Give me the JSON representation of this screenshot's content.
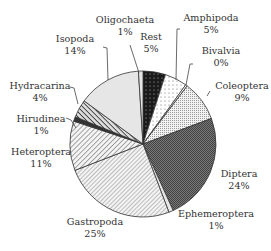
{
  "chart_data": {
    "type": "pie",
    "title": "",
    "start_angle_deg": 0,
    "direction": "clockwise",
    "center": [
      143,
      144
    ],
    "radius": 73,
    "slices": [
      {
        "label": "Rest",
        "value": 5,
        "pct_label": "5%",
        "pattern": "black-dots",
        "label_pos": [
          151,
          41
        ],
        "leader": null
      },
      {
        "label": "Amphipoda",
        "value": 5,
        "pct_label": "5%",
        "pattern": "sparse-dots",
        "label_pos": [
          211,
          22
        ],
        "leader": [
          [
            180,
            29
          ],
          [
            177,
            29
          ],
          [
            176,
            80
          ]
        ]
      },
      {
        "label": "Bivalvia",
        "value": 0.4,
        "pct_label": "0%",
        "pattern": "white",
        "label_pos": [
          221,
          55
        ],
        "leader": [
          [
            193,
            64
          ],
          [
            190,
            64
          ],
          [
            186,
            85
          ]
        ]
      },
      {
        "label": "Coleoptera",
        "value": 9,
        "pct_label": "9%",
        "pattern": "fine-dots",
        "label_pos": [
          242,
          90
        ],
        "leader": [
          [
            210,
            91
          ],
          [
            207,
            96
          ]
        ]
      },
      {
        "label": "Diptera",
        "value": 24,
        "pct_label": "24%",
        "pattern": "dark-checker",
        "label_pos": [
          239,
          178
        ],
        "leader": null
      },
      {
        "label": "Ephemeroptera",
        "value": 1,
        "pct_label": "1%",
        "pattern": "light-grey",
        "label_pos": [
          216,
          218
        ],
        "leader": null
      },
      {
        "label": "Gastropoda",
        "value": 25,
        "pct_label": "25%",
        "pattern": "fine-diag",
        "label_pos": [
          95,
          226
        ],
        "leader": null
      },
      {
        "label": "Heteroptera",
        "value": 11,
        "pct_label": "11%",
        "pattern": "diag",
        "label_pos": [
          41,
          156
        ],
        "leader": null
      },
      {
        "label": "Hirudinea",
        "value": 1,
        "pct_label": "1%",
        "pattern": "dark",
        "label_pos": [
          41,
          123
        ],
        "leader": [
          [
            66,
            118
          ],
          [
            71,
            120
          ],
          [
            76,
            128
          ]
        ]
      },
      {
        "label": "Hydracarina",
        "value": 4,
        "pct_label": "4%",
        "pattern": "bold-diag",
        "label_pos": [
          40,
          90
        ],
        "leader": [
          [
            70,
            87
          ],
          [
            74,
            88
          ],
          [
            78,
            104
          ]
        ]
      },
      {
        "label": "Isopoda",
        "value": 14,
        "pct_label": "14%",
        "pattern": "light-grey",
        "label_pos": [
          75,
          43
        ],
        "leader": [
          [
            103,
            47
          ],
          [
            107,
            48
          ],
          [
            108,
            80
          ]
        ]
      },
      {
        "label": "Oligochaeta",
        "value": 1,
        "pct_label": "1%",
        "pattern": "light-grey",
        "label_pos": [
          125,
          24
        ],
        "leader": [
          [
            130,
            45
          ],
          [
            139,
            73
          ]
        ]
      }
    ]
  }
}
